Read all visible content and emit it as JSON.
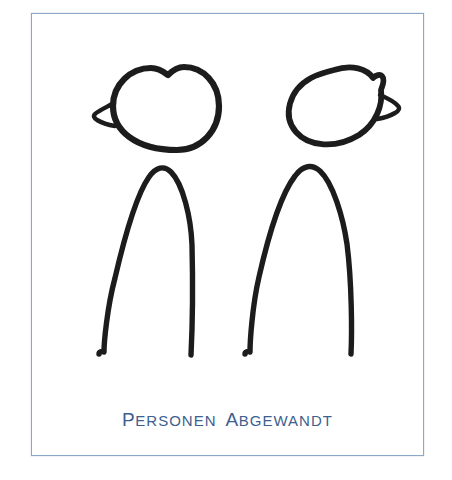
{
  "canvas": {
    "width": 452,
    "height": 480,
    "background_color": "#ffffff"
  },
  "card": {
    "border_color": "#8aa9c9",
    "background_color": "#ffffff",
    "x": 31,
    "y": 13,
    "width": 393,
    "height": 443
  },
  "illustration": {
    "name": "two-stick-figures-facing-away",
    "stroke_color": "#1c1c1c",
    "description": "Two hand-drawn pictogram figures seen from behind: rounded heads with a single ear each, and arched inverted-U bodies",
    "figures": [
      {
        "id": "figure-left",
        "head_shape": "round-with-top-notch",
        "ear_side": "left",
        "body_shape": "arch"
      },
      {
        "id": "figure-right",
        "head_shape": "tilted-oval",
        "ear_side": "right",
        "body_shape": "arch"
      }
    ]
  },
  "caption": {
    "full_text": "PERSONEN ABGEWANDT",
    "color": "#3d5f8f",
    "words": [
      {
        "lead": "P",
        "rest": "ERSONEN"
      },
      {
        "lead": "A",
        "rest": "BGEWANDT"
      }
    ]
  }
}
